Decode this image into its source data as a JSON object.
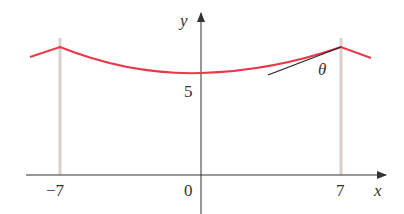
{
  "diagram": {
    "x_axis_label": "x",
    "y_axis_label": "y",
    "angle_label": "θ",
    "y_tick_label": "5",
    "x_tick_labels": {
      "left": "−7",
      "origin": "0",
      "right": "7"
    },
    "colors": {
      "curve": "#e8394a",
      "axes": "#333333",
      "poles": "#d9cfcb",
      "tangent": "#222222"
    }
  }
}
